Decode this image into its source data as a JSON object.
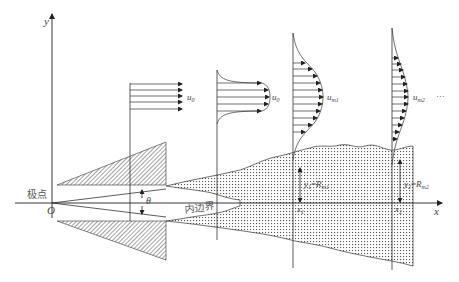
{
  "axes": {
    "x_label": "x",
    "y_label": "y",
    "origin_label": "O"
  },
  "labels": {
    "pole": "极点",
    "inner_boundary": "内边界",
    "angle": "θ",
    "u0_a": "u",
    "u0_a_sub": "0",
    "u0_b": "u",
    "u0_b_sub": "0",
    "um1": "u",
    "um1_sub": "m1",
    "um2": "u",
    "um2_sub": "m2",
    "ellipsis": "···",
    "x1": "x",
    "x1_sub": "1",
    "x2": "x",
    "x2_sub": "2",
    "r1_y": "y",
    "r1_y_sub": "1",
    "r1_eq": "=",
    "r1_R": "R",
    "r1_R_sub": "m1",
    "r2_y": "y",
    "r2_y_sub": "2",
    "r2_eq": "=",
    "r2_R": "R",
    "r2_R_sub": "m2"
  },
  "colors": {
    "line": "#333333",
    "text": "#444444",
    "hatch": "#333333",
    "dots": "#555555"
  }
}
